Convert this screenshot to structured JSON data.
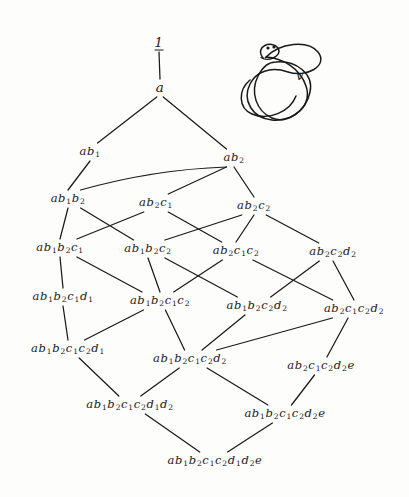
{
  "diagram": {
    "title_node": "1",
    "type": "hasse-lattice",
    "background_color": "#fdfdfb",
    "ink_color": "#1a1a1a",
    "knot": {
      "label": "v",
      "name": "knot-diagram"
    },
    "nodes": [
      {
        "id": "one",
        "label": "1",
        "x": 159,
        "y": 43,
        "style": "top"
      },
      {
        "id": "a",
        "label": "a",
        "x": 160,
        "y": 88,
        "style": "a"
      },
      {
        "id": "ab1",
        "label": "ab₁",
        "x": 90,
        "y": 152,
        "style": ""
      },
      {
        "id": "ab2",
        "label": "ab₂",
        "x": 234,
        "y": 158,
        "style": ""
      },
      {
        "id": "ab1b2",
        "label": "ab₁b₂",
        "x": 68,
        "y": 199,
        "style": ""
      },
      {
        "id": "ab2c1",
        "label": "ab₂c₁",
        "x": 156,
        "y": 203,
        "style": ""
      },
      {
        "id": "ab2c2",
        "label": "ab₂c₂",
        "x": 254,
        "y": 206,
        "style": ""
      },
      {
        "id": "ab1b2c1",
        "label": "ab₁b₂c₁",
        "x": 60,
        "y": 248,
        "style": ""
      },
      {
        "id": "ab1b2c2",
        "label": "ab₁b₂c₂",
        "x": 148,
        "y": 249,
        "style": ""
      },
      {
        "id": "ab2c1c2",
        "label": "ab₂c₁c₂",
        "x": 236,
        "y": 251,
        "style": ""
      },
      {
        "id": "ab2c2d2",
        "label": "ab₂c₂d₂",
        "x": 333,
        "y": 252,
        "style": ""
      },
      {
        "id": "ab1b2c1d1",
        "label": "ab₁b₂c₁d₁",
        "x": 63,
        "y": 297,
        "style": ""
      },
      {
        "id": "ab1b2c1c2",
        "label": "ab₁b₂c₁c₂",
        "x": 160,
        "y": 301,
        "style": ""
      },
      {
        "id": "ab1b2c2d2",
        "label": "ab₁b₂c₂d₂",
        "x": 257,
        "y": 306,
        "style": ""
      },
      {
        "id": "ab2c1c2d2",
        "label": "ab₂c₁c₂d₂",
        "x": 354,
        "y": 309,
        "style": ""
      },
      {
        "id": "ab1b2c1c2d1",
        "label": "ab₁b₂c₁c₂d₁",
        "x": 68,
        "y": 349,
        "style": ""
      },
      {
        "id": "ab1b2c1c2d2",
        "label": "ab₁b₂c₁c₂d₂",
        "x": 190,
        "y": 359,
        "style": ""
      },
      {
        "id": "ab2c1c2d2e",
        "label": "ab₂c₁c₂d₂e",
        "x": 321,
        "y": 366,
        "style": ""
      },
      {
        "id": "ab1b2c1c2d1d2",
        "label": "ab₁b₂c₁c₂d₁d₂",
        "x": 130,
        "y": 405,
        "style": ""
      },
      {
        "id": "ab1b2c1c2d2e",
        "label": "ab₁b₂c₁c₂d₂e",
        "x": 285,
        "y": 414,
        "style": ""
      },
      {
        "id": "ab1b2c1c2d1d2e",
        "label": "ab₁b₂c₁c₂d₁d₂e",
        "x": 215,
        "y": 461,
        "style": ""
      }
    ],
    "edges": [
      {
        "from": "one",
        "to": "a",
        "curve": false
      },
      {
        "from": "a",
        "to": "ab1",
        "curve": false
      },
      {
        "from": "a",
        "to": "ab2",
        "curve": false
      },
      {
        "from": "ab1",
        "to": "ab1b2",
        "curve": false
      },
      {
        "from": "ab2",
        "to": "ab1b2",
        "curve": true
      },
      {
        "from": "ab2",
        "to": "ab2c1",
        "curve": false
      },
      {
        "from": "ab2",
        "to": "ab2c2",
        "curve": false
      },
      {
        "from": "ab1b2",
        "to": "ab1b2c1",
        "curve": false
      },
      {
        "from": "ab1b2",
        "to": "ab1b2c2",
        "curve": false
      },
      {
        "from": "ab2c1",
        "to": "ab1b2c1",
        "curve": false
      },
      {
        "from": "ab2c1",
        "to": "ab2c1c2",
        "curve": false
      },
      {
        "from": "ab2c2",
        "to": "ab1b2c2",
        "curve": false
      },
      {
        "from": "ab2c2",
        "to": "ab2c1c2",
        "curve": false
      },
      {
        "from": "ab2c2",
        "to": "ab2c2d2",
        "curve": false
      },
      {
        "from": "ab1b2c1",
        "to": "ab1b2c1d1",
        "curve": false
      },
      {
        "from": "ab1b2c1",
        "to": "ab1b2c1c2",
        "curve": false
      },
      {
        "from": "ab1b2c2",
        "to": "ab1b2c1c2",
        "curve": false
      },
      {
        "from": "ab1b2c2",
        "to": "ab1b2c2d2",
        "curve": false
      },
      {
        "from": "ab2c1c2",
        "to": "ab1b2c1c2",
        "curve": false
      },
      {
        "from": "ab2c1c2",
        "to": "ab2c1c2d2",
        "curve": false
      },
      {
        "from": "ab2c2d2",
        "to": "ab1b2c2d2",
        "curve": false
      },
      {
        "from": "ab2c2d2",
        "to": "ab2c1c2d2",
        "curve": false
      },
      {
        "from": "ab1b2c1d1",
        "to": "ab1b2c1c2d1",
        "curve": false
      },
      {
        "from": "ab1b2c1c2",
        "to": "ab1b2c1c2d1",
        "curve": false
      },
      {
        "from": "ab1b2c1c2",
        "to": "ab1b2c1c2d2",
        "curve": false
      },
      {
        "from": "ab1b2c2d2",
        "to": "ab1b2c1c2d2",
        "curve": false
      },
      {
        "from": "ab2c1c2d2",
        "to": "ab1b2c1c2d2",
        "curve": false
      },
      {
        "from": "ab2c1c2d2",
        "to": "ab2c1c2d2e",
        "curve": false
      },
      {
        "from": "ab1b2c1c2d1",
        "to": "ab1b2c1c2d1d2",
        "curve": false
      },
      {
        "from": "ab1b2c1c2d2",
        "to": "ab1b2c1c2d1d2",
        "curve": false
      },
      {
        "from": "ab1b2c1c2d2",
        "to": "ab1b2c1c2d2e",
        "curve": false
      },
      {
        "from": "ab2c1c2d2e",
        "to": "ab1b2c1c2d2e",
        "curve": false
      },
      {
        "from": "ab1b2c1c2d1d2",
        "to": "ab1b2c1c2d1d2e",
        "curve": false
      },
      {
        "from": "ab1b2c1c2d2e",
        "to": "ab1b2c1c2d1d2e",
        "curve": false
      }
    ]
  }
}
